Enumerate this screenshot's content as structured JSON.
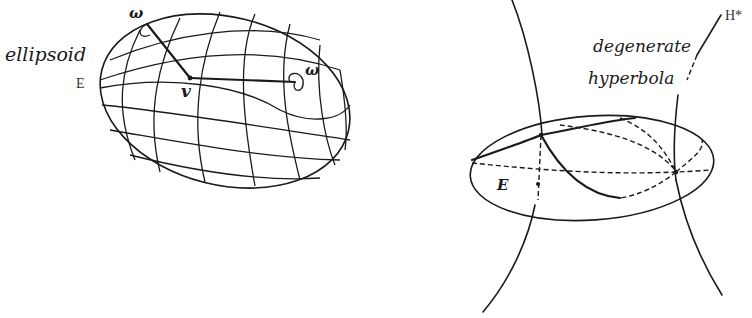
{
  "left_figure": {
    "labels": {
      "ellipsoid": "ellipsoid",
      "E": "E",
      "omega_top": "ω",
      "omega_right": "ω",
      "v": "v"
    }
  },
  "right_figure": {
    "labels": {
      "H_star": "H*",
      "degenerate": "degenerate",
      "hyperbola": "hyperbola",
      "E": "E"
    }
  },
  "colors": {
    "ink": "#1a1a1a",
    "background": "#ffffff"
  }
}
